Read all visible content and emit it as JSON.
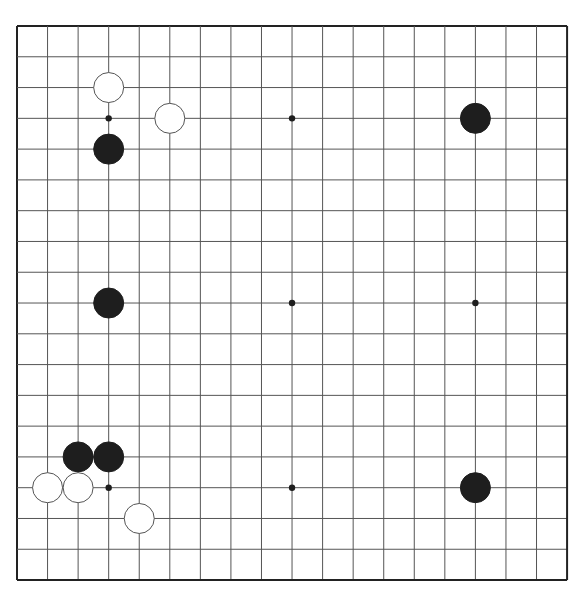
{
  "board": {
    "size": 19,
    "origin_x": 17,
    "origin_y": 26,
    "spacing_x": 30.56,
    "spacing_y": 30.78,
    "line_color": "#555555",
    "border_color": "#222222",
    "background": "#ffffff",
    "stone_radius": 15,
    "hoshi": [
      [
        3,
        3
      ],
      [
        9,
        3
      ],
      [
        15,
        3
      ],
      [
        3,
        9
      ],
      [
        9,
        9
      ],
      [
        15,
        9
      ],
      [
        3,
        15
      ],
      [
        9,
        15
      ],
      [
        15,
        15
      ]
    ],
    "stones": [
      {
        "color": "white",
        "col": 3,
        "row": 2
      },
      {
        "color": "white",
        "col": 5,
        "row": 3
      },
      {
        "color": "black",
        "col": 3,
        "row": 4
      },
      {
        "color": "black",
        "col": 15,
        "row": 3
      },
      {
        "color": "black",
        "col": 3,
        "row": 9
      },
      {
        "color": "black",
        "col": 2,
        "row": 14
      },
      {
        "color": "black",
        "col": 3,
        "row": 14
      },
      {
        "color": "white",
        "col": 1,
        "row": 15
      },
      {
        "color": "white",
        "col": 2,
        "row": 15
      },
      {
        "color": "white",
        "col": 4,
        "row": 16
      },
      {
        "color": "black",
        "col": 15,
        "row": 15
      }
    ],
    "colors": {
      "black_stone": "#1e1e1e",
      "white_stone": "#ffffff",
      "white_stone_outline": "#555555"
    }
  }
}
